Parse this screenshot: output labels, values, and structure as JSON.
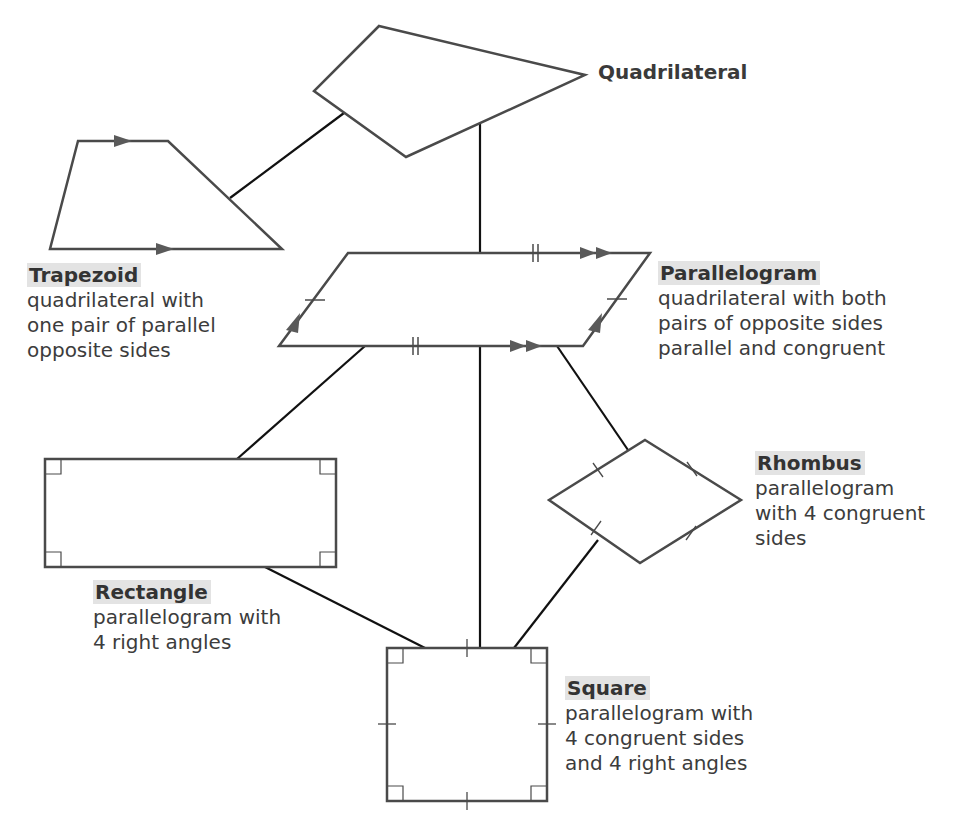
{
  "diagram": {
    "type": "hierarchy",
    "colors": {
      "shape_stroke": "#4a4a4a",
      "connector": "#111111",
      "title_highlight": "#e3e3e3",
      "text": "#3c3c3c"
    },
    "nodes": {
      "quadrilateral": {
        "title": "Quadrilateral"
      },
      "trapezoid": {
        "title": "Trapezoid",
        "desc": [
          "quadrilateral with",
          "one pair of parallel",
          "opposite sides"
        ]
      },
      "parallelogram": {
        "title": "Parallelogram",
        "desc": [
          "quadrilateral with both",
          "pairs of opposite sides",
          "parallel and congruent"
        ]
      },
      "rectangle": {
        "title": "Rectangle",
        "desc": [
          "parallelogram with",
          "4 right angles"
        ]
      },
      "rhombus": {
        "title": "Rhombus",
        "desc": [
          "parallelogram",
          "with 4 congruent",
          "sides"
        ]
      },
      "square": {
        "title": "Square",
        "desc": [
          "parallelogram with",
          "4 congruent sides",
          "and 4 right angles"
        ]
      }
    },
    "edges": [
      [
        "quadrilateral",
        "trapezoid"
      ],
      [
        "quadrilateral",
        "parallelogram"
      ],
      [
        "parallelogram",
        "rectangle"
      ],
      [
        "parallelogram",
        "rhombus"
      ],
      [
        "parallelogram",
        "square"
      ],
      [
        "rectangle",
        "square"
      ],
      [
        "rhombus",
        "square"
      ]
    ]
  }
}
